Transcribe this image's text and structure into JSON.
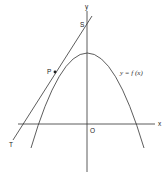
{
  "diagram": {
    "labels": {
      "y_axis": "y",
      "x_axis": "x",
      "origin": "O",
      "point_s": "S",
      "point_p": "P",
      "point_t": "T",
      "curve": "y = f (x)"
    },
    "colors": {
      "stroke": "#333333",
      "background": "#ffffff"
    }
  }
}
